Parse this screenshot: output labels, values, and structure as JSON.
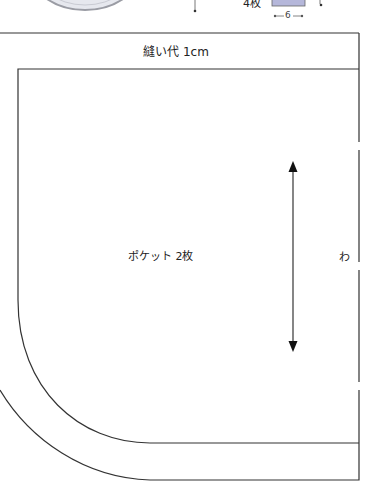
{
  "top_fragment": {
    "piece_count_label": "4枚",
    "dimension_label": "6",
    "rect_fill": "#b5b7da"
  },
  "pattern": {
    "seam_allowance_label": "縫い代 1cm",
    "piece_label": "ポケット 2枚",
    "fold_label": "わ",
    "grain_arrow": "double-headed vertical grainline",
    "line_color": "#333333"
  }
}
